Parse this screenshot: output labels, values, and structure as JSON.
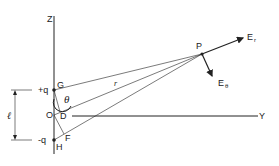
{
  "diagram": {
    "axes": {
      "z_label": "Z",
      "y_label": "Y"
    },
    "charges": {
      "positive": "+q",
      "negative": "-q"
    },
    "points": {
      "G": "G",
      "O": "O",
      "D": "D",
      "F": "F",
      "H": "H",
      "P": "P"
    },
    "distance_label": "r",
    "angle_label": "θ",
    "separation_label": "ℓ",
    "field_components": {
      "radial": "E",
      "radial_sub": "r",
      "polar": "E",
      "polar_sub": "θ"
    },
    "colors": {
      "ink": "#222222",
      "background": "#ffffff"
    }
  }
}
